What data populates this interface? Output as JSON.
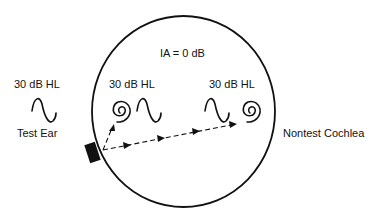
{
  "diagram": {
    "title": "IA = 0 dB",
    "test_ear": {
      "level_label": "30 dB HL",
      "name_label": "Test Ear"
    },
    "test_cochlea": {
      "level_label": "30 dB HL"
    },
    "nontest_cochlea": {
      "level_label": "30 dB HL",
      "name_label": "Nontest Cochlea"
    },
    "icons": {
      "skull": "circle-outline",
      "oscillator": "bone-conduction-oscillator",
      "tone": "sine-wave",
      "cochlea": "spiral",
      "signal_path": "dashed-arrow"
    },
    "colors": {
      "stroke": "#111111",
      "background": "#ffffff"
    }
  }
}
